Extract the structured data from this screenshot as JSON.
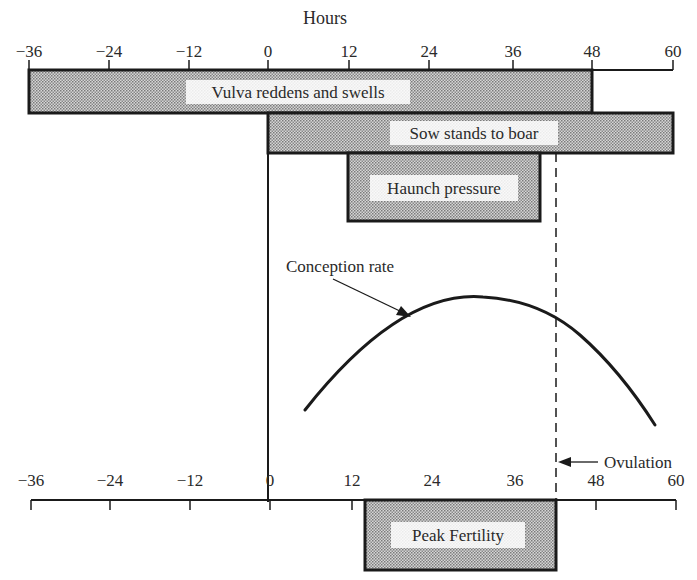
{
  "title": "Hours",
  "axes": {
    "top": {
      "ticks": [
        {
          "label": "−36",
          "value": -36,
          "x": 29
        },
        {
          "label": "−24",
          "value": -24,
          "x": 109
        },
        {
          "label": "−12",
          "value": -12,
          "x": 189
        },
        {
          "label": "0",
          "value": 0,
          "x": 268
        },
        {
          "label": "12",
          "value": 12,
          "x": 349
        },
        {
          "label": "24",
          "value": 24,
          "x": 429
        },
        {
          "label": "36",
          "value": 36,
          "x": 513
        },
        {
          "label": "48",
          "value": 48,
          "x": 592
        },
        {
          "label": "60",
          "value": 60,
          "x": 673
        }
      ]
    },
    "bottom": {
      "ticks": [
        {
          "label": "−36",
          "value": -36,
          "x": 31
        },
        {
          "label": "−24",
          "value": -24,
          "x": 110
        },
        {
          "label": "−12",
          "value": -12,
          "x": 190
        },
        {
          "label": "0",
          "value": 0,
          "x": 270
        },
        {
          "label": "12",
          "value": 12,
          "x": 352
        },
        {
          "label": "24",
          "value": 24,
          "x": 432
        },
        {
          "label": "36",
          "value": 36,
          "x": 515
        },
        {
          "label": "48",
          "value": 48,
          "x": 596
        },
        {
          "label": "60",
          "value": 60,
          "x": 676
        }
      ]
    }
  },
  "bars": [
    {
      "label": "Vulva reddens and swells",
      "start_hour": -36,
      "end_hour": 48
    },
    {
      "label": "Sow stands to boar",
      "start_hour": 0,
      "end_hour": 60
    },
    {
      "label": "Haunch pressure",
      "start_hour": 12,
      "end_hour": 41
    },
    {
      "label": "Peak Fertility",
      "start_hour": 14,
      "end_hour": 43
    }
  ],
  "curve": {
    "label": "Conception rate",
    "start_hour": 5,
    "peak_hour": 32,
    "end_hour": 57
  },
  "markers": {
    "ovulation": {
      "label": "Ovulation",
      "hour": 43
    },
    "onset": {
      "hour": 0
    }
  },
  "colors": {
    "ink": "#1a1a1a",
    "fill": "#c8c8c8",
    "label_bg": "#ffffff"
  }
}
